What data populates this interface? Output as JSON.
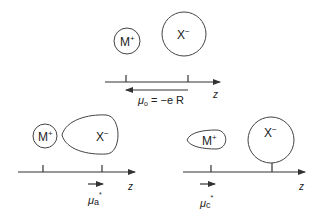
{
  "figure": {
    "panels": [
      {
        "id": "top",
        "cation": {
          "symbol": "M",
          "charge": "+",
          "shape": "circle"
        },
        "anion": {
          "symbol": "X",
          "charge": "−",
          "shape": "circle"
        },
        "axis_label": "z",
        "dipole_label": {
          "mu": "μ",
          "sub": "o",
          "rest": " = −e R"
        },
        "dipole_direction": "left"
      },
      {
        "id": "bottom-left",
        "cation": {
          "symbol": "M",
          "charge": "+",
          "shape": "circle"
        },
        "anion": {
          "symbol": "X",
          "charge": "−",
          "shape": "teardrop"
        },
        "axis_label": "z",
        "dipole_label": {
          "mu": "μ",
          "sub": "a",
          "sup": "*"
        },
        "dipole_direction": "right"
      },
      {
        "id": "bottom-right",
        "cation": {
          "symbol": "M",
          "charge": "+",
          "shape": "teardrop"
        },
        "anion": {
          "symbol": "X",
          "charge": "−",
          "shape": "circle"
        },
        "axis_label": "z",
        "dipole_label": {
          "mu": "μ",
          "sub": "c",
          "sup": "*"
        },
        "dipole_direction": "right"
      }
    ]
  }
}
